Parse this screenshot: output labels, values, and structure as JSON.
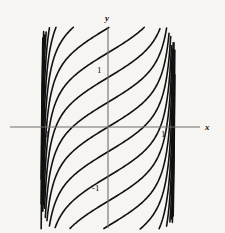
{
  "figure": {
    "background_color": "#f6f5f1",
    "curve_color": "#111111",
    "axis_color": "#6b6b6b",
    "width": 225,
    "height": 233
  },
  "axes": {
    "x_label": "x",
    "y_label": "y",
    "origin_px": {
      "x": 108,
      "y": 127
    },
    "unit_px": 55,
    "x_axis_extent_px": {
      "start": 10,
      "end": 200
    },
    "y_axis_extent_px": {
      "start": 28,
      "end": 228
    }
  },
  "ticks": {
    "y_positive": "1",
    "y_negative": "-1",
    "x_positive": "1",
    "x_negative": "-1"
  },
  "chart_data": {
    "type": "line",
    "title": "",
    "xlabel": "x",
    "ylabel": "y",
    "xlim": [
      -1.78,
      1.67
    ],
    "ylim": [
      -1.84,
      1.8
    ],
    "grid": false,
    "legend": "none",
    "xtick_values": [
      -1,
      1
    ],
    "xtick_labels": [
      "-1",
      "1"
    ],
    "ytick_values": [
      -1,
      1
    ],
    "ytick_labels": [
      "1",
      "-1"
    ],
    "y_axis_crossings": [
      1.8,
      1.35,
      0.9,
      0.45,
      0.0,
      -0.45,
      -0.9,
      -1.35,
      -1.8
    ],
    "series": [
      {
        "name": "c=+4",
        "offset": 1.8
      },
      {
        "name": "c=+3",
        "offset": 1.35
      },
      {
        "name": "c=+2",
        "offset": 0.9
      },
      {
        "name": "c=+1",
        "offset": 0.45
      },
      {
        "name": "c=0",
        "offset": 0.0
      },
      {
        "name": "c=-1",
        "offset": -0.45
      },
      {
        "name": "c=-2",
        "offset": -0.9
      },
      {
        "name": "c=-3",
        "offset": -1.35
      },
      {
        "name": "c=-4",
        "offset": -1.8
      }
    ],
    "edge_branch_count_left": 9,
    "edge_branch_count_right": 9
  }
}
